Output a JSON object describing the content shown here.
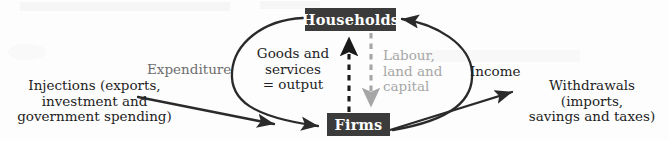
{
  "diagram": {
    "background_color": "#fdfdfd",
    "nodes": [
      {
        "id": "households",
        "label": "Households",
        "fill": "#3b3b3b",
        "text_color": "#ffffff"
      },
      {
        "id": "firms",
        "label": "Firms",
        "fill": "#3b3b3b",
        "text_color": "#ffffff"
      }
    ],
    "labels": {
      "injections": "Injections (exports,\ninvestment and\ngovernment spending)",
      "expenditure": "Expenditure",
      "goods_services": "Goods and\nservices\n= output",
      "labour_land_capital": "Labour,\nland and\ncapital",
      "income": "Income",
      "withdrawals": "Withdrawals (imports,\nsavings and taxes)"
    },
    "colors": {
      "ink": "#1e1e1e",
      "muted_ink": "#6e6e6e",
      "light_ink": "#a6a6a6",
      "box_fill": "#3b3b3b",
      "box_text": "#ffffff",
      "arrow_solid": "#2a2a2a",
      "arrow_dashed_black": "#1a1a1a",
      "arrow_dashed_grey": "#a6a6a6"
    },
    "flows": [
      {
        "id": "expenditure-flow",
        "from": "households",
        "to": "firms",
        "style": "curved-solid",
        "side": "left",
        "label": "Expenditure"
      },
      {
        "id": "goods-services-flow",
        "from": "firms",
        "to": "households",
        "style": "dashed-vertical",
        "color": "#1a1a1a",
        "label": "Goods and services = output"
      },
      {
        "id": "labour-flow",
        "from": "households",
        "to": "firms",
        "style": "dashed-vertical",
        "color": "#a6a6a6",
        "label": "Labour, land and capital"
      },
      {
        "id": "income-flow",
        "from": "firms",
        "to": "households",
        "style": "curved-solid",
        "side": "right",
        "label": "Income"
      },
      {
        "id": "injections-flow",
        "to": "firms",
        "style": "straight-solid",
        "label": "Injections (exports, investment and government spending)"
      },
      {
        "id": "withdrawals-flow",
        "from": "firms",
        "style": "straight-solid",
        "label": "Withdrawals (imports, savings and taxes)"
      }
    ]
  }
}
